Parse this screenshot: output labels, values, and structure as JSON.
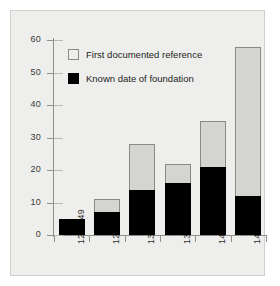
{
  "chart_data": {
    "type": "bar",
    "subtype": "stacked",
    "title": "",
    "xlabel": "",
    "ylabel": "",
    "categories": [
      "1240-49",
      "1250-59",
      "1300-49",
      "1350-99",
      "1400-49",
      "1450-99"
    ],
    "series": [
      {
        "name": "Known date of foundation",
        "color": "#000000",
        "values": [
          5,
          7,
          14,
          16,
          21,
          12
        ]
      },
      {
        "name": "First documented reference",
        "color": "#d4d4d0",
        "values": [
          0,
          4,
          14,
          6,
          14,
          46
        ]
      }
    ],
    "totals": [
      5,
      11,
      28,
      22,
      35,
      58
    ],
    "ylim": [
      0,
      60
    ],
    "yticks": [
      0,
      10,
      20,
      30,
      40,
      50,
      60
    ],
    "ytick_labels": [
      "0",
      "10",
      "20",
      "30",
      "40",
      "50",
      "60"
    ],
    "grid": false,
    "legend_position": "upper-left",
    "legend": [
      {
        "label": "First documented reference",
        "swatch": "light"
      },
      {
        "label": "Known date of foundation",
        "swatch": "dark"
      }
    ]
  },
  "axis": {
    "y_ticks": [
      {
        "value": 60,
        "label": "60"
      },
      {
        "value": 50,
        "label": "50"
      },
      {
        "value": 40,
        "label": "40"
      },
      {
        "value": 30,
        "label": "30"
      },
      {
        "value": 20,
        "label": "20"
      },
      {
        "value": 10,
        "label": "10"
      },
      {
        "value": 0,
        "label": "0"
      }
    ],
    "x_labels": [
      "1240-49",
      "1250-59",
      "1300-49",
      "1350-99",
      "1400-49",
      "1450-99"
    ]
  },
  "legend": {
    "first_documented_reference": "First documented reference",
    "known_date_of_foundation": "Known date of foundation"
  },
  "colors": {
    "background": "#eeeeec",
    "bar_light": "#d4d4d0",
    "bar_dark": "#000000",
    "axis": "#8e8e8a",
    "text": "#1d1d1b"
  }
}
